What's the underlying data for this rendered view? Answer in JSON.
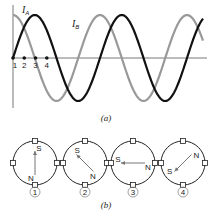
{
  "figure": {
    "part_a": {
      "caption": "(a)",
      "curve_a": {
        "name": "I",
        "subscript": "A",
        "color": "#999999",
        "function": "cos"
      },
      "curve_b": {
        "name": "I",
        "subscript": "B",
        "color": "#111111",
        "function": "sin"
      },
      "time_points": [
        "1",
        "2",
        "3",
        "4"
      ],
      "cycles_shown": 2.2
    },
    "part_b": {
      "caption": "(b)",
      "rotors": [
        {
          "label": "1",
          "n_label": "N",
          "s_label": "S",
          "angle_deg": 90
        },
        {
          "label": "2",
          "n_label": "N",
          "s_label": "S",
          "angle_deg": 135
        },
        {
          "label": "3",
          "n_label": "N",
          "s_label": "S",
          "angle_deg": 180
        },
        {
          "label": "4",
          "n_label": "N",
          "s_label": "S",
          "angle_deg": 225
        }
      ]
    }
  }
}
